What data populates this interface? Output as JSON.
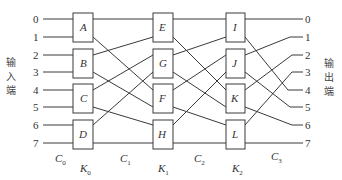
{
  "diagram": {
    "input_side_label": [
      "输",
      "入",
      "端"
    ],
    "output_side_label": [
      "输",
      "出",
      "端"
    ],
    "input_ports": [
      "0",
      "1",
      "2",
      "3",
      "4",
      "5",
      "6",
      "7"
    ],
    "output_ports": [
      "0",
      "1",
      "2",
      "3",
      "4",
      "5",
      "6",
      "7"
    ],
    "stages": [
      {
        "name": "K",
        "sub": "0",
        "switches": [
          "A",
          "B",
          "C",
          "D"
        ]
      },
      {
        "name": "K",
        "sub": "1",
        "switches": [
          "E",
          "G",
          "F",
          "H"
        ]
      },
      {
        "name": "K",
        "sub": "2",
        "switches": [
          "I",
          "J",
          "K",
          "L"
        ]
      }
    ],
    "connections": [
      {
        "name": "C",
        "sub": "0"
      },
      {
        "name": "C",
        "sub": "1"
      },
      {
        "name": "C",
        "sub": "2"
      },
      {
        "name": "C",
        "sub": "3"
      }
    ],
    "links": {
      "C0": [
        [
          "in0",
          "A.0"
        ],
        [
          "in1",
          "A.1"
        ],
        [
          "in2",
          "B.0"
        ],
        [
          "in3",
          "B.1"
        ],
        [
          "in4",
          "C.0"
        ],
        [
          "in5",
          "C.1"
        ],
        [
          "in6",
          "D.0"
        ],
        [
          "in7",
          "D.1"
        ]
      ],
      "C1": [
        [
          "A.0",
          "E.0"
        ],
        [
          "A.1",
          "F.0"
        ],
        [
          "B.0",
          "E.1"
        ],
        [
          "B.1",
          "F.1"
        ],
        [
          "C.0",
          "G.0"
        ],
        [
          "C.1",
          "H.0"
        ],
        [
          "D.0",
          "G.1"
        ],
        [
          "D.1",
          "H.1"
        ]
      ],
      "C2": [
        [
          "E.0",
          "I.0"
        ],
        [
          "E.1",
          "K.0"
        ],
        [
          "G.0",
          "I.1"
        ],
        [
          "G.1",
          "K.1"
        ],
        [
          "F.0",
          "J.0"
        ],
        [
          "F.1",
          "L.0"
        ],
        [
          "H.0",
          "J.1"
        ],
        [
          "H.1",
          "L.1"
        ]
      ],
      "C3": [
        [
          "I.0",
          "out0"
        ],
        [
          "I.1",
          "out4"
        ],
        [
          "J.0",
          "out1"
        ],
        [
          "J.1",
          "out5"
        ],
        [
          "K.0",
          "out2"
        ],
        [
          "K.1",
          "out6"
        ],
        [
          "L.0",
          "out3"
        ],
        [
          "L.1",
          "out7"
        ]
      ]
    }
  }
}
